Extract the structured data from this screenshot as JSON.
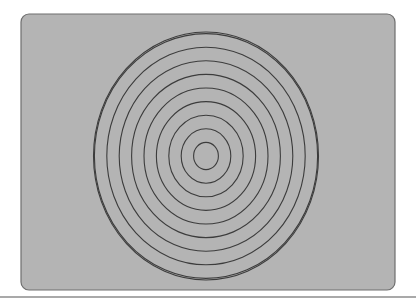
{
  "canvas": {
    "width": 416,
    "height": 305,
    "background_color": "#ffffff"
  },
  "panel": {
    "name": "concentric-circles-panel",
    "shape": "rounded-rectangle",
    "x": 21,
    "y": 14,
    "width": 374,
    "height": 276,
    "corner_radius": 8,
    "fill_color": "#b4b4b4",
    "border_color": "#6e6e6e",
    "border_width": 1.2
  },
  "chart_data": {
    "type": "scatter",
    "title": "",
    "subtitle": "",
    "xlabel": "",
    "ylabel": "",
    "grid": false,
    "legend": "none",
    "figure_kind": "concentric-ellipses",
    "center": {
      "x": 206,
      "y": 156
    },
    "ring_count": 10,
    "stroke_color": "#3c3c3c",
    "stroke_width": 1.1,
    "fill": "none",
    "radius_step_x": 12.4,
    "radius_step_y": 13.6,
    "rings": [
      {
        "index": 1,
        "rx": 12.4,
        "ry": 13.6
      },
      {
        "index": 2,
        "rx": 24.8,
        "ry": 27.2
      },
      {
        "index": 3,
        "rx": 37.2,
        "ry": 40.8
      },
      {
        "index": 4,
        "rx": 49.6,
        "ry": 54.4
      },
      {
        "index": 5,
        "rx": 62.0,
        "ry": 68.0
      },
      {
        "index": 6,
        "rx": 74.4,
        "ry": 81.6
      },
      {
        "index": 7,
        "rx": 86.8,
        "ry": 95.2
      },
      {
        "index": 8,
        "rx": 99.2,
        "ry": 108.8
      },
      {
        "index": 9,
        "rx": 111.6,
        "ry": 122.4
      },
      {
        "index": 10,
        "rx": 112.5,
        "ry": 124.0
      }
    ],
    "x": [
      206
    ],
    "values": [
      156
    ],
    "xlim": [
      21,
      395
    ],
    "ylim": [
      14,
      290
    ]
  },
  "bottom_rule": {
    "name": "bottom-divider",
    "y": 297,
    "x_start": 0,
    "x_end": 416,
    "color": "#555555",
    "thickness": 1.2
  }
}
